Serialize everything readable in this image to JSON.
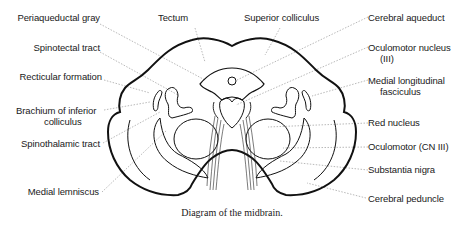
{
  "diagram": {
    "title": "Diagram of the midbrain.",
    "labels_left": [
      {
        "id": "periaqueductal-gray",
        "text": "Periaqueductal gray"
      },
      {
        "id": "spinotectal-tract",
        "text": "Spinotectal tract"
      },
      {
        "id": "recticular-formation",
        "text": "Recticular formation"
      },
      {
        "id": "brachium-inferior-colliculus",
        "text": "Brachium of inferior",
        "text2": "colliculus"
      },
      {
        "id": "spinothalamic-tract",
        "text": "Spinothalamic tract"
      },
      {
        "id": "medial-lemniscus",
        "text": "Medial lemniscus"
      }
    ],
    "labels_top": [
      {
        "id": "tectum",
        "text": "Tectum"
      },
      {
        "id": "superior-colliculus",
        "text": "Superior colliculus"
      }
    ],
    "labels_right": [
      {
        "id": "cerebral-aqueduct",
        "text": "Cerebral aqueduct"
      },
      {
        "id": "oculomotor-nucleus",
        "text": "Oculomotor nucleus",
        "text2": "(III)"
      },
      {
        "id": "medial-longitudinal-fasciculus",
        "text": "Medial longitudinal",
        "text2": "fasciculus"
      },
      {
        "id": "red-nucleus",
        "text": "Red nucleus"
      },
      {
        "id": "oculomotor-cn-iii",
        "text": "Oculomotor (CN III)"
      },
      {
        "id": "substantia-nigra",
        "text": "Substantia nigra"
      },
      {
        "id": "cerebral-peduncle",
        "text": "Cerebral peduncle"
      }
    ],
    "colors": {
      "outline": "#111111",
      "leader": "#888888",
      "text": "#1a1a1a"
    }
  }
}
